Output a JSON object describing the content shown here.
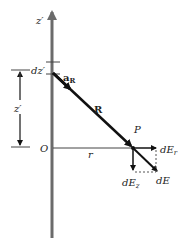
{
  "diagram": {
    "labels": {
      "z_axis": "z′",
      "dz": "dz′",
      "unit_vector": "a",
      "unit_vector_sub": "R",
      "z_height": "z′",
      "origin": "O",
      "radius": "r",
      "R_vector": "R",
      "point": "P",
      "dE_r": "dE",
      "dE_r_sub": "r",
      "dE_z": "dE",
      "dE_z_sub": "z",
      "dE": "dE"
    },
    "colors": {
      "axis": "#6b6b6b",
      "vector": "#111111",
      "text": "#222222"
    }
  }
}
